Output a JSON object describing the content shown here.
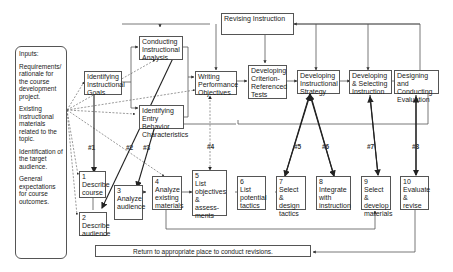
{
  "inputs": {
    "title": "Inputs:",
    "items": [
      "Requirements/ rationale for the course development project.",
      "Existing instructional materials related to the topic.",
      "Identification of the target audience.",
      "General expectations for course outcomes."
    ]
  },
  "top_row": {
    "revising": "Revising Instruction",
    "identifying_goals": "Identifying Instructional Goals",
    "conducting_analysis": "Conducting Instructional Analysis",
    "entry_behavior": "Identifying Entry Behavior Characteristics",
    "writing_objectives": "Writing Performance Objectives",
    "criterion_tests": "Developing Criterion-Referenced Tests",
    "strategy": "Developing Instructional Strategy",
    "selecting_instruction": "Developing & Selecting Instruction",
    "evaluation": "Designing and Conducting Evaluation"
  },
  "bottom_row": [
    {
      "num": "1",
      "label": "Describe course"
    },
    {
      "num": "2",
      "label": "Describe audience"
    },
    {
      "num": "3",
      "label": "Analyze audience"
    },
    {
      "num": "4",
      "label": "Analyze existing materials"
    },
    {
      "num": "5",
      "label": "List objectives & assess-ments"
    },
    {
      "num": "6",
      "label": "List potential tactics"
    },
    {
      "num": "7",
      "label": "Select & design tactics"
    },
    {
      "num": "8",
      "label": "Integrate with instruction"
    },
    {
      "num": "9",
      "label": "Select & develop materials"
    },
    {
      "num": "10",
      "label": "Evaluate & revise"
    }
  ],
  "links": [
    "#1",
    "#2",
    "#3",
    "#4",
    "#5",
    "#6",
    "#7",
    "#8"
  ],
  "return_text": "Return to appropriate place to conduct revisions."
}
